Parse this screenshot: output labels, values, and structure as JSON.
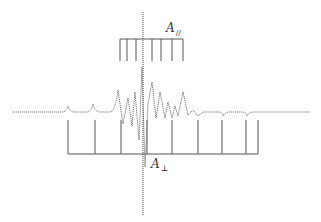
{
  "figure": {
    "type": "stick-diagram-with-spectrum",
    "line_color": "#555555",
    "spectrum_color": "#777777"
  },
  "labels": {
    "a_parallel": {
      "symbol": "A",
      "subscript": "//"
    },
    "a_perp": {
      "symbol": "A",
      "subscript": "⊥"
    }
  },
  "top_comb": {
    "bar_y": 39,
    "tick_bottom_y": 61,
    "x_start": 120,
    "x_end": 183,
    "ticks_x": [
      120,
      127,
      136,
      152,
      161,
      172,
      183
    ]
  },
  "bottom_comb": {
    "bar_y": 154,
    "tick_top_y": 120,
    "x_start": 68,
    "x_end": 258,
    "ticks_x": [
      68,
      95,
      121,
      147,
      172,
      198,
      222,
      246,
      258
    ]
  },
  "center_line": {
    "x": 143,
    "y_top": 12,
    "y_bottom": 215
  },
  "spectrum": {
    "baseline_y": 112,
    "x_start": 12,
    "x_end": 310
  }
}
